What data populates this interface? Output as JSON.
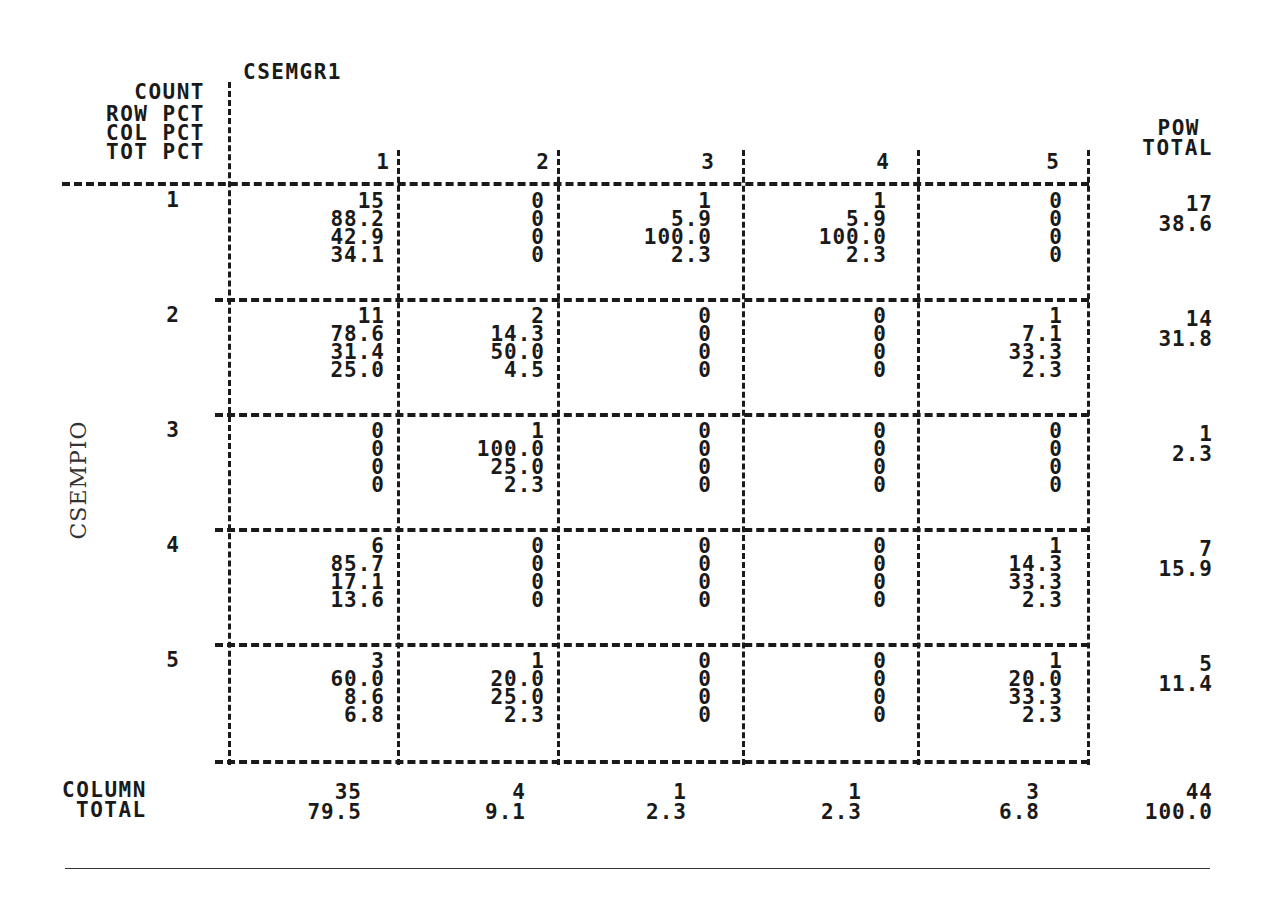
{
  "table": {
    "column_variable": "CSEMGR1",
    "row_variable": "CSEMPIO",
    "cell_legend": [
      "COUNT",
      "ROW PCT",
      "COL PCT",
      "TOT PCT"
    ],
    "row_total_header": [
      "POW",
      "TOTAL"
    ],
    "column_total_header": [
      "COLUMN",
      "TOTAL"
    ],
    "column_labels": [
      "1",
      "2",
      "3",
      "4",
      "5"
    ],
    "rows": [
      {
        "label": "1",
        "cells": [
          [
            "15",
            "88.2",
            "42.9",
            "34.1"
          ],
          [
            "0",
            "0",
            "0",
            "0"
          ],
          [
            "1",
            "5.9",
            "100.0",
            "2.3"
          ],
          [
            "1",
            "5.9",
            "100.0",
            "2.3"
          ],
          [
            "0",
            "0",
            "0",
            "0"
          ]
        ],
        "row_total": [
          "17",
          "38.6"
        ]
      },
      {
        "label": "2",
        "cells": [
          [
            "11",
            "78.6",
            "31.4",
            "25.0"
          ],
          [
            "2",
            "14.3",
            "50.0",
            "4.5"
          ],
          [
            "0",
            "0",
            "0",
            "0"
          ],
          [
            "0",
            "0",
            "0",
            "0"
          ],
          [
            "1",
            "7.1",
            "33.3",
            "2.3"
          ]
        ],
        "row_total": [
          "14",
          "31.8"
        ]
      },
      {
        "label": "3",
        "cells": [
          [
            "0",
            "0",
            "0",
            "0"
          ],
          [
            "1",
            "100.0",
            "25.0",
            "2.3"
          ],
          [
            "0",
            "0",
            "0",
            "0"
          ],
          [
            "0",
            "0",
            "0",
            "0"
          ],
          [
            "0",
            "0",
            "0",
            "0"
          ]
        ],
        "row_total": [
          "1",
          "2.3"
        ]
      },
      {
        "label": "4",
        "cells": [
          [
            "6",
            "85.7",
            "17.1",
            "13.6"
          ],
          [
            "0",
            "0",
            "0",
            "0"
          ],
          [
            "0",
            "0",
            "0",
            "0"
          ],
          [
            "0",
            "0",
            "0",
            "0"
          ],
          [
            "1",
            "14.3",
            "33.3",
            "2.3"
          ]
        ],
        "row_total": [
          "7",
          "15.9"
        ]
      },
      {
        "label": "5",
        "cells": [
          [
            "3",
            "60.0",
            "8.6",
            "6.8"
          ],
          [
            "1",
            "20.0",
            "25.0",
            "2.3"
          ],
          [
            "0",
            "0",
            "0",
            "0"
          ],
          [
            "0",
            "0",
            "0",
            "0"
          ],
          [
            "1",
            "20.0",
            "33.3",
            "2.3"
          ]
        ],
        "row_total": [
          "5",
          "11.4"
        ]
      }
    ],
    "column_totals": [
      [
        "35",
        "79.5"
      ],
      [
        "4",
        "9.1"
      ],
      [
        "1",
        "2.3"
      ],
      [
        "1",
        "2.3"
      ],
      [
        "3",
        "6.8"
      ]
    ],
    "grand_total": [
      "44",
      "100.0"
    ]
  }
}
